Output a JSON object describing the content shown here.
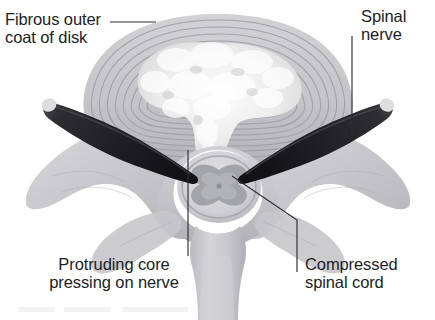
{
  "figure": {
    "background_color": "#ffffff",
    "text_color": "#201d28",
    "leader_line_color": "#2f2c36"
  },
  "labels": [
    {
      "id": "fibrous-outer-coat",
      "text": "Fibrous outer\ncoat of disk",
      "position": "top-left",
      "leader": "horizontal line from label to annulus fibrosus rings"
    },
    {
      "id": "spinal-nerve",
      "text": "Spinal\nnerve",
      "position": "top-right",
      "leader": "vertical line down to dark spinal nerve root"
    },
    {
      "id": "protruding-core",
      "text": "Protruding core\npressing on nerve",
      "position": "bottom-left",
      "leader": "vertical line up to protruding nucleus pulposus"
    },
    {
      "id": "compressed-spinal-cord",
      "text": "Compressed\nspinal cord",
      "position": "bottom-right",
      "leader": "elbow line up-left to spinal cord gray matter"
    }
  ],
  "anatomy": {
    "disk_body": {
      "name": "intervertebral disk body",
      "fill": "#c9c9cc",
      "ring_count": 9,
      "ring_color": "#9b9ba2"
    },
    "nucleus_pulposus": {
      "name": "nucleus pulposus (soft core)",
      "fill": "#f2f2f2",
      "note": "protrudes downward toward spinal cord"
    },
    "spinal_nerves": {
      "name": "spinal nerve roots",
      "fill": "#2a2a2e",
      "tip_fill": "#e2e2e2",
      "count": 2
    },
    "spinal_cord": {
      "name": "compressed spinal cord",
      "outer_fill": "#d8d8da",
      "gray_matter_fill": "#a9a9af",
      "canal_fill": "#ffffff"
    },
    "vertebra": {
      "name": "vertebral arch with transverse and spinous processes",
      "fill": "#c4c4c8",
      "shade": "#ababb1"
    }
  }
}
